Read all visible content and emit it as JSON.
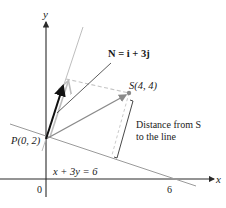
{
  "diagram": {
    "type": "vector-projection",
    "axes": {
      "x_label": "x",
      "y_label": "y",
      "origin_label": "0",
      "x_tick_label": "6"
    },
    "points": {
      "P": {
        "label": "P(0, 2)",
        "x": 0,
        "y": 2
      },
      "S": {
        "label": "S(4, 4)",
        "x": 4,
        "y": 4
      }
    },
    "line": {
      "equation": "x + 3y = 6"
    },
    "normal_vector": {
      "label_N": "N",
      "label_rest": " = i + 3j",
      "components": [
        1,
        3
      ]
    },
    "annotation": {
      "line1": "Distance from S",
      "line2": "to the line"
    },
    "colors": {
      "axis": "#2a2a2a",
      "line": "#9a9a9a",
      "vector": "#111111",
      "projection": "#bdbdbd",
      "point": "#8a8a8a"
    }
  }
}
